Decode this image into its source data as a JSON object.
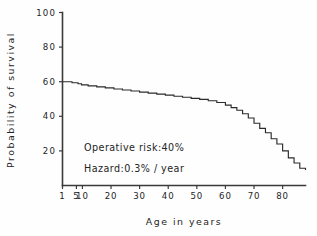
{
  "chart_data": {
    "type": "line",
    "title": "",
    "subtitle": "",
    "xlabel": "Age in years",
    "ylabel": "Probability of survival",
    "xlim": [
      1,
      88
    ],
    "ylim": [
      0,
      100
    ],
    "grid": false,
    "legend": "none",
    "step_style": "post",
    "xticks": [
      1,
      5,
      10,
      20,
      30,
      40,
      50,
      60,
      70,
      80
    ],
    "xtick_labels": [
      "1",
      "5",
      "10",
      "20",
      "30",
      "40",
      "50",
      "60",
      "70",
      "80"
    ],
    "yticks": [
      20,
      40,
      60,
      80,
      100
    ],
    "ytick_labels": [
      "20",
      "40",
      "60",
      "80",
      "100"
    ],
    "series": [
      {
        "name": "Probability of survival",
        "x": [
          1,
          3,
          6,
          9,
          12,
          15,
          18,
          21,
          24,
          27,
          30,
          33,
          36,
          39,
          42,
          45,
          48,
          51,
          54,
          57,
          60,
          62,
          64,
          66,
          68,
          70,
          72,
          74,
          76,
          78,
          80,
          82,
          84,
          86,
          88
        ],
        "values": [
          60,
          59.4,
          58.8,
          58.2,
          57.6,
          57,
          56.4,
          55.8,
          55.2,
          54.6,
          54,
          53.4,
          52.8,
          52.2,
          51.6,
          51,
          50.4,
          49.8,
          49,
          48,
          46.5,
          45,
          43.5,
          41.5,
          39,
          36,
          33,
          30.5,
          27,
          24,
          20,
          16,
          13,
          10,
          9
        ]
      }
    ],
    "annotations": [
      {
        "text": "Operative risk:40%",
        "x": 12,
        "y": 23
      },
      {
        "text": "Hazard:0.3% / year",
        "x": 12,
        "y": 16
      }
    ],
    "colors": {
      "line": "#2b2b2b",
      "axis": "#3a3a3a",
      "text": "#242424",
      "background": "#fefefe"
    }
  },
  "figure": {
    "xaxis_title": "Age in years",
    "yaxis_title": "Probability of survival",
    "annotation_operative_risk": "Operative risk:40%",
    "annotation_hazard": "Hazard:0.3% / year"
  }
}
